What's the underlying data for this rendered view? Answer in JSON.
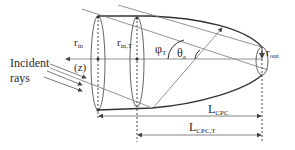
{
  "diagram": {
    "type": "truncated compound parabolic concentrator (CPC) geometry",
    "colors": {
      "stroke": "#3a3a3a",
      "light_stroke": "#7a7a7a",
      "text": "#2a2a2a",
      "background": "#ffffff"
    },
    "labels": {
      "incident_line1": "Incident",
      "incident_line2": "rays",
      "z_axis": "(z)",
      "r_in_main": "r",
      "r_in_sub": "in",
      "r_in_t_main": "r",
      "r_in_t_sub": "in,T",
      "phi_t_main": "φ",
      "phi_t_sub": "T",
      "theta_a_main": "θ",
      "theta_a_sub": "a",
      "r_out_main": "r",
      "r_out_sub": "out",
      "l_cpc_main": "L",
      "l_cpc_sub": "CPC",
      "l_cpc_t_main": "L",
      "l_cpc_t_sub": "CPC,T"
    }
  }
}
